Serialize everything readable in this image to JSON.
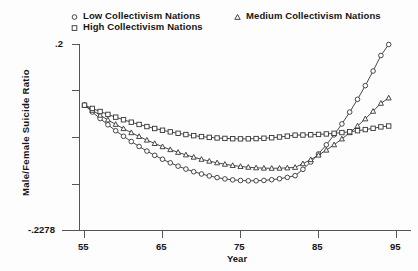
{
  "chart_data": {
    "type": "line",
    "title": "",
    "xlabel": "Year",
    "ylabel": "Male/Female Suicide Ratio",
    "xlim": [
      55,
      95
    ],
    "ylim": [
      -0.2278,
      0.2
    ],
    "xticks": [
      55,
      65,
      75,
      85,
      95
    ],
    "xticklabels": [
      "55",
      "65",
      "75",
      "85",
      "95"
    ],
    "yticks": [
      0.2,
      -0.2278
    ],
    "yticklabels": [
      ".2",
      "-.2278"
    ],
    "grid": false,
    "legend_position": "top",
    "series": [
      {
        "name": "Low Collectivism Nations",
        "marker": "circle",
        "x": [
          55,
          56,
          57,
          58,
          59,
          60,
          61,
          62,
          63,
          64,
          65,
          66,
          67,
          68,
          69,
          70,
          71,
          72,
          73,
          74,
          75,
          76,
          77,
          78,
          79,
          80,
          81,
          82,
          83,
          84,
          85,
          86,
          87,
          88,
          89,
          90,
          91,
          92,
          93,
          94
        ],
        "values": [
          0.0605,
          0.0447,
          0.0296,
          0.0153,
          0.0017,
          -0.0111,
          -0.0232,
          -0.0345,
          -0.0451,
          -0.0549,
          -0.0639,
          -0.0722,
          -0.0798,
          -0.0865,
          -0.0926,
          -0.0978,
          -0.1023,
          -0.1061,
          -0.1091,
          -0.1113,
          -0.1128,
          -0.1135,
          -0.1134,
          -0.1126,
          -0.111,
          -0.1087,
          -0.1056,
          -0.1017,
          -0.0871,
          -0.0704,
          -0.0516,
          -0.0308,
          -0.0078,
          0.0173,
          0.0445,
          0.0739,
          0.1054,
          0.139,
          0.1747,
          0.2
        ]
      },
      {
        "name": "Medium Collectivism Nations",
        "marker": "triangle",
        "x": [
          55,
          56,
          57,
          58,
          59,
          60,
          61,
          62,
          63,
          64,
          65,
          66,
          67,
          68,
          69,
          70,
          71,
          72,
          73,
          74,
          75,
          76,
          77,
          78,
          79,
          80,
          81,
          82,
          83,
          84,
          85,
          86,
          87,
          88,
          89,
          90,
          91,
          92,
          93,
          94
        ],
        "values": [
          0.0605,
          0.0487,
          0.0374,
          0.0266,
          0.0163,
          0.0065,
          -0.0028,
          -0.0116,
          -0.0199,
          -0.0277,
          -0.035,
          -0.0418,
          -0.0481,
          -0.0539,
          -0.0592,
          -0.064,
          -0.0683,
          -0.0721,
          -0.0754,
          -0.0782,
          -0.0805,
          -0.0823,
          -0.0836,
          -0.0844,
          -0.0847,
          -0.0845,
          -0.0838,
          -0.0826,
          -0.0742,
          -0.0648,
          -0.0544,
          -0.043,
          -0.0306,
          -0.0172,
          -0.0028,
          0.0126,
          0.029,
          0.0464,
          0.0648,
          0.077
        ]
      },
      {
        "name": "High Collectivism Nations",
        "marker": "square",
        "x": [
          55,
          56,
          57,
          58,
          59,
          60,
          61,
          62,
          63,
          64,
          65,
          66,
          67,
          68,
          69,
          70,
          71,
          72,
          73,
          74,
          75,
          76,
          77,
          78,
          79,
          80,
          81,
          82,
          83,
          84,
          85,
          86,
          87,
          88,
          89,
          90,
          91,
          92,
          93,
          94
        ],
        "values": [
          0.0605,
          0.053,
          0.0459,
          0.0392,
          0.0329,
          0.0269,
          0.0213,
          0.0161,
          0.0113,
          0.0068,
          0.0028,
          -0.0009,
          -0.0042,
          -0.0071,
          -0.0097,
          -0.0118,
          -0.0136,
          -0.015,
          -0.016,
          -0.0167,
          -0.017,
          -0.0169,
          -0.0164,
          -0.0156,
          -0.0144,
          -0.0128,
          -0.0108,
          -0.0085,
          -0.0082,
          -0.0076,
          -0.0068,
          -0.0057,
          -0.0043,
          -0.0026,
          -0.0006,
          0.0017,
          0.0043,
          0.0072,
          0.0105,
          0.0125
        ]
      }
    ]
  },
  "legend": {
    "low": "Low Collectivism Nations",
    "high": "High Collectivism Nations",
    "medium": "Medium Collectivism Nations"
  },
  "axes": {
    "y_label": "Male/Female Suicide Ratio",
    "x_label": "Year",
    "y_top_tick": ".2",
    "y_bottom_tick": "-.2278",
    "x_tick_1": "55",
    "x_tick_2": "65",
    "x_tick_3": "75",
    "x_tick_4": "85",
    "x_tick_5": "95"
  },
  "style": {
    "line_color": "#333333",
    "axis_color": "#555555",
    "text_color": "#161616",
    "background": "#fdfdfd"
  }
}
